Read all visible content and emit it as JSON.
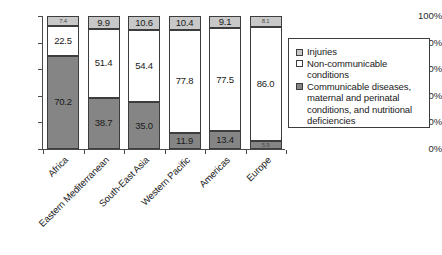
{
  "chart_data": {
    "type": "bar",
    "stacked": true,
    "stack_mode": "percent",
    "title": "",
    "subtitle": "",
    "xlabel": "",
    "ylabel": "",
    "ylim": [
      0,
      100
    ],
    "y_ticks": [
      "0%",
      "20%",
      "40%",
      "60%",
      "80%",
      "100%"
    ],
    "y_tick_values": [
      0,
      20,
      40,
      60,
      80,
      100
    ],
    "grid": false,
    "legend_position": "right",
    "categories": [
      "Africa",
      "Eastern Mediterranean",
      "South-East Asia",
      "Western Pacific",
      "Americas",
      "Europe"
    ],
    "series": [
      {
        "name": "Injuries",
        "color": "#c8c8c8",
        "values": [
          7.4,
          9.9,
          10.6,
          10.4,
          9.1,
          8.1
        ]
      },
      {
        "name": "Non-communicable conditions",
        "color": "#ffffff",
        "values": [
          22.5,
          51.4,
          54.4,
          77.8,
          77.5,
          86.0
        ]
      },
      {
        "name": "Communicable diseases, maternal and perinatal conditions, and nutritional deficiencies",
        "color": "#858585",
        "values": [
          70.2,
          38.7,
          35.0,
          11.9,
          13.4,
          5.9
        ]
      }
    ],
    "data_labels": {
      "injuries": [
        "7.4",
        "9.9",
        "10.6",
        "10.4",
        "9.1",
        "8.1"
      ],
      "noncommunicable": [
        "22.5",
        "51.4",
        "54.4",
        "77.8",
        "77.5",
        "86.0"
      ],
      "communicable": [
        "70.2",
        "38.7",
        "35.0",
        "11.9",
        "13.4",
        "5.9"
      ]
    }
  },
  "legend": {
    "items": [
      {
        "label": "Injuries",
        "color": "#c8c8c8",
        "swatch": "injuries-swatch"
      },
      {
        "label": "Non-communicable conditions",
        "color": "#ffffff",
        "swatch": "noncommunicable-swatch"
      },
      {
        "label": "Communicable diseases, maternal and perinatal conditions, and nutritional deficiencies",
        "color": "#858585",
        "swatch": "communicable-swatch"
      }
    ]
  },
  "colors": {
    "injuries": "#c8c8c8",
    "noncommunicable": "#ffffff",
    "communicable": "#858585",
    "axis": "#4a4a4a",
    "outline": "#3d3d3d",
    "background": "#ffffff",
    "text": "#1a1a1a"
  }
}
